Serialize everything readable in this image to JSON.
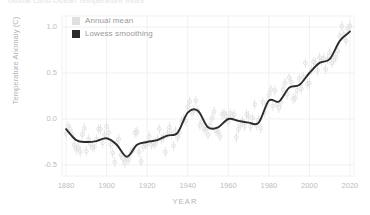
{
  "chart_data": {
    "type": "scatter",
    "title": "Global Land-Ocean Temperature Index",
    "xlabel": "YEAR",
    "ylabel": "Temperature Anomaly (C)",
    "xlim": [
      1878,
      2022
    ],
    "ylim": [
      -0.62,
      1.12
    ],
    "xticks": [
      1880,
      1900,
      1920,
      1940,
      1960,
      1980,
      2000,
      2020
    ],
    "yticks": [
      -0.5,
      0.0,
      0.5,
      1.0
    ],
    "ytick_labels": [
      "-0.5",
      "0.0",
      "0.5",
      "1.0"
    ],
    "grid": true,
    "legend_position": "top-left",
    "series": [
      {
        "name": "Annual mean",
        "type": "scatter",
        "marker": "open-circle",
        "color": "#e0e0e0",
        "x": [
          1880,
          1881,
          1882,
          1883,
          1884,
          1885,
          1886,
          1887,
          1888,
          1889,
          1890,
          1891,
          1892,
          1893,
          1894,
          1895,
          1896,
          1897,
          1898,
          1899,
          1900,
          1901,
          1902,
          1903,
          1904,
          1905,
          1906,
          1907,
          1908,
          1909,
          1910,
          1911,
          1912,
          1913,
          1914,
          1915,
          1916,
          1917,
          1918,
          1919,
          1920,
          1921,
          1922,
          1923,
          1924,
          1925,
          1926,
          1927,
          1928,
          1929,
          1930,
          1931,
          1932,
          1933,
          1934,
          1935,
          1936,
          1937,
          1938,
          1939,
          1940,
          1941,
          1942,
          1943,
          1944,
          1945,
          1946,
          1947,
          1948,
          1949,
          1950,
          1951,
          1952,
          1953,
          1954,
          1955,
          1956,
          1957,
          1958,
          1959,
          1960,
          1961,
          1962,
          1963,
          1964,
          1965,
          1966,
          1967,
          1968,
          1969,
          1970,
          1971,
          1972,
          1973,
          1974,
          1975,
          1976,
          1977,
          1978,
          1979,
          1980,
          1981,
          1982,
          1983,
          1984,
          1985,
          1986,
          1987,
          1988,
          1989,
          1990,
          1991,
          1992,
          1993,
          1994,
          1995,
          1996,
          1997,
          1998,
          1999,
          2000,
          2001,
          2002,
          2003,
          2004,
          2005,
          2006,
          2007,
          2008,
          2009,
          2010,
          2011,
          2012,
          2013,
          2014,
          2015,
          2016,
          2017,
          2018,
          2019,
          2020
        ],
        "y": [
          -0.16,
          -0.08,
          -0.11,
          -0.17,
          -0.28,
          -0.33,
          -0.31,
          -0.36,
          -0.17,
          -0.1,
          -0.35,
          -0.22,
          -0.27,
          -0.31,
          -0.3,
          -0.22,
          -0.11,
          -0.11,
          -0.26,
          -0.17,
          -0.08,
          -0.15,
          -0.28,
          -0.37,
          -0.47,
          -0.26,
          -0.22,
          -0.39,
          -0.43,
          -0.48,
          -0.43,
          -0.44,
          -0.36,
          -0.34,
          -0.15,
          -0.14,
          -0.36,
          -0.46,
          -0.3,
          -0.28,
          -0.27,
          -0.19,
          -0.28,
          -0.26,
          -0.27,
          -0.22,
          -0.11,
          -0.22,
          -0.2,
          -0.36,
          -0.16,
          -0.09,
          -0.16,
          -0.29,
          -0.13,
          -0.2,
          -0.15,
          -0.03,
          0.0,
          -0.02,
          0.13,
          0.19,
          0.07,
          0.09,
          0.2,
          0.09,
          -0.07,
          -0.03,
          -0.11,
          -0.11,
          -0.17,
          -0.07,
          0.01,
          0.08,
          -0.13,
          -0.14,
          -0.19,
          0.05,
          0.06,
          0.03,
          -0.03,
          0.06,
          0.03,
          0.05,
          -0.2,
          -0.11,
          -0.06,
          -0.02,
          -0.08,
          0.05,
          0.03,
          -0.08,
          0.01,
          0.16,
          -0.07,
          -0.01,
          -0.1,
          0.18,
          0.07,
          0.16,
          0.26,
          0.32,
          0.14,
          0.31,
          0.16,
          0.12,
          0.18,
          0.32,
          0.39,
          0.27,
          0.45,
          0.4,
          0.22,
          0.23,
          0.31,
          0.44,
          0.33,
          0.46,
          0.61,
          0.38,
          0.39,
          0.53,
          0.62,
          0.61,
          0.53,
          0.67,
          0.63,
          0.66,
          0.54,
          0.65,
          0.72,
          0.61,
          0.64,
          0.67,
          0.74,
          0.9,
          1.01,
          0.92,
          0.85,
          0.98,
          1.01
        ],
        "yerr": 0.055
      },
      {
        "name": "Lowess smoothing",
        "type": "line",
        "color": "#2b2b2b",
        "x": [
          1880,
          1885,
          1890,
          1895,
          1900,
          1905,
          1910,
          1915,
          1920,
          1925,
          1930,
          1935,
          1940,
          1945,
          1950,
          1955,
          1960,
          1965,
          1970,
          1975,
          1980,
          1985,
          1990,
          1995,
          2000,
          2005,
          2010,
          2015,
          2020
        ],
        "y": [
          -0.11,
          -0.23,
          -0.25,
          -0.24,
          -0.21,
          -0.28,
          -0.41,
          -0.28,
          -0.25,
          -0.23,
          -0.18,
          -0.15,
          0.07,
          0.09,
          -0.09,
          -0.09,
          0.0,
          -0.02,
          -0.04,
          -0.04,
          0.2,
          0.19,
          0.34,
          0.37,
          0.5,
          0.61,
          0.65,
          0.85,
          0.95
        ]
      }
    ]
  }
}
